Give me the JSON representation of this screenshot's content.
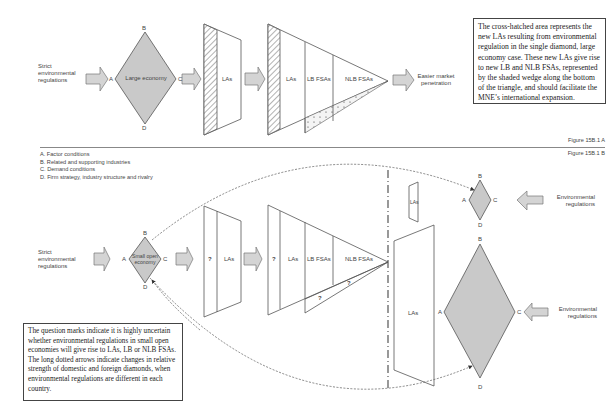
{
  "figure_a": {
    "caption": "Figure 15B.1 A",
    "input_label": "Strict environmental regulations",
    "diamond": {
      "label": "Large economy",
      "vertices": {
        "top": "B",
        "left": "A",
        "right": "C",
        "bottom": "D"
      }
    },
    "stage1": {
      "label": "LAs"
    },
    "stage2": {
      "labels": [
        "LAs",
        "LB FSAs",
        "NLB FSAs"
      ]
    },
    "output_label": "Easier market penetration",
    "note": "The cross-hatched area represents the new LAs resulting from environmental regulation in the single diamond, large economy case. These new LAs give rise to new LB and NLB FSAs, represented by the shaded wedge along the bottom of the triangle, and should facilitate the MNE’s international expansion."
  },
  "figure_b": {
    "caption": "Figure 15B.1 B",
    "legend": [
      "A. Factor conditions",
      "B. Related and supporting industries",
      "C. Demand conditions",
      "D. Firm strategy, industry structure and rivalry"
    ],
    "input_label": "Strict environmental regulations",
    "diamond": {
      "label": "Small open economy",
      "vertices": {
        "top": "B",
        "left": "A",
        "right": "C",
        "bottom": "D"
      }
    },
    "stage1": {
      "question": "?",
      "label": "LAs"
    },
    "stage2": {
      "question": "?",
      "labels": [
        "LAs",
        "LB FSAs",
        "NLB FSAs"
      ],
      "wedge_questions": [
        "?",
        "?"
      ]
    },
    "foreign_small": {
      "las_label": "LAs",
      "diamond_vertices": {
        "top": "B",
        "left": "A",
        "right": "C",
        "bottom": "D"
      },
      "input_label": "Environmental regulations"
    },
    "foreign_large": {
      "las_label": "LAs",
      "diamond_vertices": {
        "top": "B",
        "left": "A",
        "right": "C",
        "bottom": "D"
      },
      "input_label": "Environmental regulations"
    },
    "note": "The question marks indicate it is highly uncertain whether environmental regulations in small open economies will give rise to LAs, LB or NLB FSAs. The long dotted arrows indicate changes in relative strength of domestic and foreign diamonds, when environmental regulations are different in each country."
  },
  "colors": {
    "diamond_fill": "#c9c9c9",
    "arrow_fill": "#d4d4d4",
    "stroke": "#555555"
  }
}
